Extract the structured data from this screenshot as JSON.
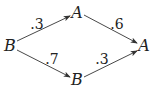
{
  "nodes": [
    {
      "id": "b_left",
      "label": "B"
    },
    {
      "id": "a_top",
      "label": "A"
    },
    {
      "id": "a_right",
      "label": "A"
    },
    {
      "id": "b_bottom",
      "label": "B"
    }
  ],
  "edges": [
    {
      "from": "b_left",
      "to": "a_top",
      "label": ".3"
    },
    {
      "from": "a_top",
      "to": "a_right",
      "label": ".6"
    },
    {
      "from": "b_left",
      "to": "b_bottom",
      "label": ".7"
    },
    {
      "from": "b_bottom",
      "to": "a_right",
      "label": ".3"
    }
  ]
}
